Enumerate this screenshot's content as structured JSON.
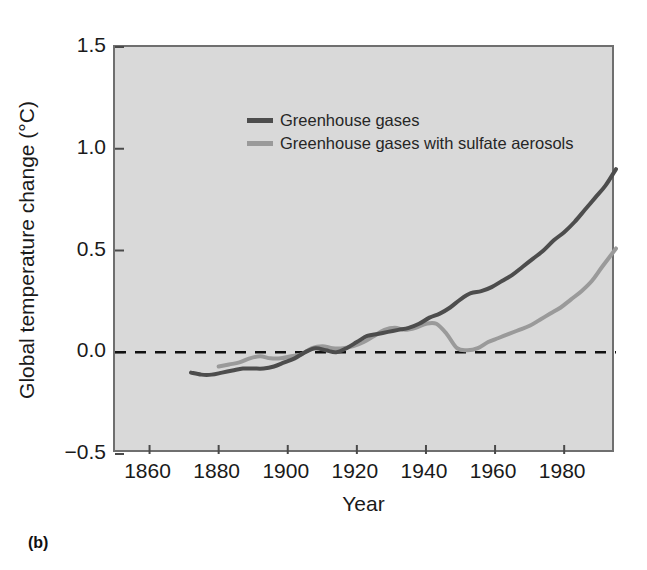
{
  "figure": {
    "panel_label": "(b)",
    "background_color": "#ffffff",
    "plot_background_color": "#d9d9d9",
    "frame_color": "#6f6f6f"
  },
  "chart_data": {
    "type": "line",
    "title": "",
    "subtitle": "",
    "xlabel": "Year",
    "ylabel": "Global temperature change (°C)",
    "xlim": [
      1850,
      1995
    ],
    "ylim": [
      -0.5,
      1.5
    ],
    "xticks": [
      1860,
      1880,
      1900,
      1920,
      1940,
      1960,
      1980
    ],
    "xtick_labels": [
      "1860",
      "1880",
      "1900",
      "1920",
      "1940",
      "1960",
      "1980"
    ],
    "yticks": [
      -0.5,
      0.0,
      0.5,
      1.0,
      1.5
    ],
    "ytick_labels": [
      "−0.5",
      "0.0",
      "0.5",
      "1.0",
      "1.5"
    ],
    "grid": false,
    "legend_position": "upper-left",
    "annotations": [
      {
        "type": "hline",
        "y": 0.0,
        "style": "dashed",
        "color": "#111111",
        "label": "zero reference line"
      }
    ],
    "series": [
      {
        "name": "Greenhouse gases",
        "color": "#4d4d4d",
        "linewidth": 4,
        "x": [
          1872,
          1875,
          1878,
          1881,
          1884,
          1887,
          1890,
          1893,
          1896,
          1899,
          1902,
          1905,
          1908,
          1911,
          1914,
          1917,
          1920,
          1923,
          1926,
          1929,
          1932,
          1935,
          1938,
          1941,
          1944,
          1947,
          1950,
          1953,
          1956,
          1959,
          1962,
          1965,
          1968,
          1971,
          1974,
          1977,
          1980,
          1983,
          1986,
          1989,
          1992,
          1995
        ],
        "y": [
          -0.1,
          -0.11,
          -0.11,
          -0.1,
          -0.09,
          -0.08,
          -0.08,
          -0.08,
          -0.07,
          -0.05,
          -0.03,
          0.0,
          0.02,
          0.01,
          0.0,
          0.02,
          0.05,
          0.08,
          0.09,
          0.1,
          0.11,
          0.12,
          0.14,
          0.17,
          0.19,
          0.22,
          0.26,
          0.29,
          0.3,
          0.32,
          0.35,
          0.38,
          0.42,
          0.46,
          0.5,
          0.55,
          0.59,
          0.64,
          0.7,
          0.76,
          0.82,
          0.9
        ]
      },
      {
        "name": "Greenhouse gases with sulfate aerosols",
        "color": "#9a9a9a",
        "linewidth": 4,
        "x": [
          1880,
          1883,
          1886,
          1889,
          1892,
          1895,
          1898,
          1901,
          1904,
          1907,
          1910,
          1913,
          1916,
          1919,
          1922,
          1925,
          1928,
          1931,
          1934,
          1937,
          1940,
          1943,
          1946,
          1949,
          1952,
          1955,
          1958,
          1961,
          1964,
          1967,
          1970,
          1973,
          1976,
          1979,
          1982,
          1985,
          1988,
          1991,
          1995
        ],
        "y": [
          -0.07,
          -0.06,
          -0.05,
          -0.03,
          -0.02,
          -0.03,
          -0.03,
          -0.02,
          -0.01,
          0.02,
          0.03,
          0.02,
          0.02,
          0.03,
          0.05,
          0.08,
          0.11,
          0.12,
          0.11,
          0.12,
          0.14,
          0.14,
          0.09,
          0.02,
          0.01,
          0.02,
          0.05,
          0.07,
          0.09,
          0.11,
          0.13,
          0.16,
          0.19,
          0.22,
          0.26,
          0.3,
          0.35,
          0.42,
          0.51
        ]
      }
    ]
  },
  "legend": {
    "items": [
      {
        "label": "Greenhouse gases",
        "color": "#4d4d4d"
      },
      {
        "label": "Greenhouse gases with sulfate aerosols",
        "color": "#9a9a9a"
      }
    ]
  }
}
